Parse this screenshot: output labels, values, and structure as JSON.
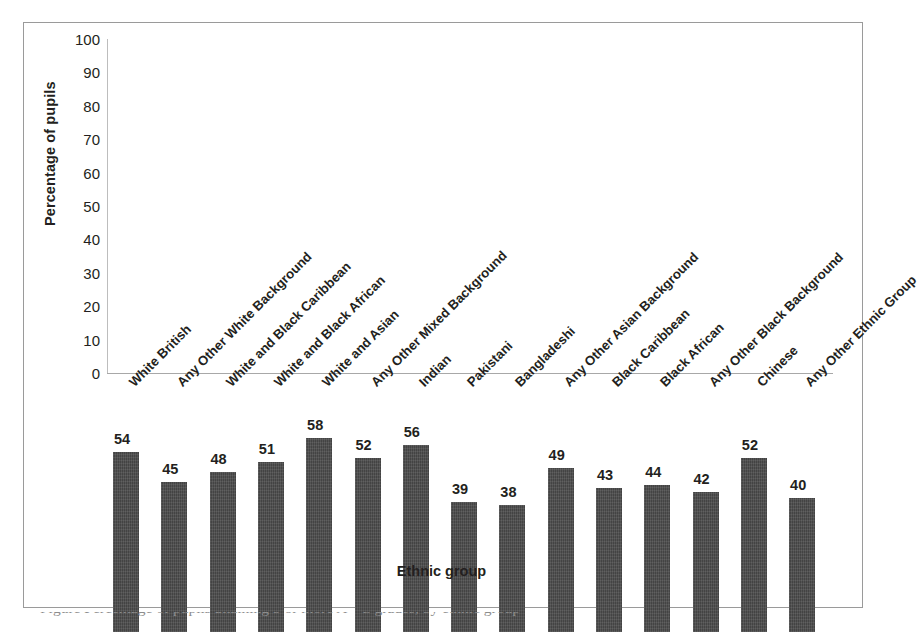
{
  "chart_data": {
    "type": "bar",
    "title": "",
    "xlabel": "Ethnic group",
    "ylabel": "Percentage of pupils",
    "ylim": [
      0,
      100
    ],
    "ytick_step": 10,
    "yticks": [
      100,
      90,
      80,
      70,
      60,
      50,
      40,
      30,
      20,
      10,
      0
    ],
    "grid": false,
    "legend": "none",
    "bar_color": "#4b4b4b",
    "data_labels": true,
    "categories": [
      "White British",
      "Any Other White Background",
      "White and Black Caribbean",
      "White and Black African",
      "White and Asian",
      "Any Other Mixed Background",
      "Indian",
      "Pakistani",
      "Bangladeshi",
      "Any Other Asian Background",
      "Black Caribbean",
      "Black African",
      "Any Other Black Background",
      "Chinese",
      "Any Other Ethnic Group"
    ],
    "values": [
      54,
      45,
      48,
      51,
      58,
      52,
      56,
      39,
      38,
      49,
      43,
      44,
      42,
      52,
      40
    ]
  },
  "caption": {
    "remnant_text": "Figure  Percentage of pupils attaining 5 or more A*-C grades, by ethnic group"
  }
}
